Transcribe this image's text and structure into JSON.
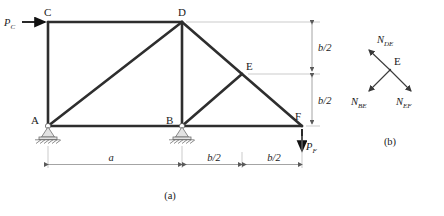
{
  "figure": {
    "caption_a": "(a)",
    "caption_b": "(b)"
  },
  "truss": {
    "nodes": [
      {
        "id": "A",
        "label": "A",
        "x": 48,
        "y": 126
      },
      {
        "id": "B",
        "label": "B",
        "x": 182,
        "y": 126
      },
      {
        "id": "C",
        "label": "C",
        "x": 48,
        "y": 22
      },
      {
        "id": "D",
        "label": "D",
        "x": 182,
        "y": 22
      },
      {
        "id": "E",
        "label": "E",
        "x": 242,
        "y": 74
      },
      {
        "id": "F",
        "label": "F",
        "x": 302,
        "y": 126
      }
    ],
    "members": [
      {
        "from": "A",
        "to": "C"
      },
      {
        "from": "C",
        "to": "D"
      },
      {
        "from": "A",
        "to": "D"
      },
      {
        "from": "A",
        "to": "B"
      },
      {
        "from": "B",
        "to": "D"
      },
      {
        "from": "B",
        "to": "E"
      },
      {
        "from": "D",
        "to": "E"
      },
      {
        "from": "E",
        "to": "F"
      },
      {
        "from": "B",
        "to": "F"
      }
    ],
    "supports": [
      {
        "at": "A",
        "type": "pinned-hatched"
      },
      {
        "at": "B",
        "type": "pinned-hatched"
      }
    ]
  },
  "loads": {
    "pc": {
      "symbol": "P",
      "subscript": "C",
      "direction": "right",
      "at": "C"
    },
    "pf": {
      "symbol": "P",
      "subscript": "F",
      "direction": "down",
      "at": "F"
    }
  },
  "dimensions": {
    "horizontal": [
      {
        "label": "a",
        "from": "A",
        "to": "B"
      },
      {
        "label": "b/2",
        "from": "B",
        "to": "mid"
      },
      {
        "label": "b/2",
        "from": "mid",
        "to": "F"
      }
    ],
    "vertical": [
      {
        "label": "b/2",
        "from": "D",
        "to": "E-level"
      },
      {
        "label": "b/2",
        "from": "E-level",
        "to": "F"
      }
    ]
  },
  "fbd": {
    "joint_label": "E",
    "forces": [
      {
        "symbol": "N",
        "subscript": "DE",
        "direction": "up-left"
      },
      {
        "symbol": "N",
        "subscript": "BE",
        "direction": "down-left"
      },
      {
        "symbol": "N",
        "subscript": "EF",
        "direction": "down-right"
      }
    ]
  },
  "colors": {
    "member": "#2e2e2e",
    "dimension": "#8d8d8d",
    "text": "#1a1a1a"
  }
}
